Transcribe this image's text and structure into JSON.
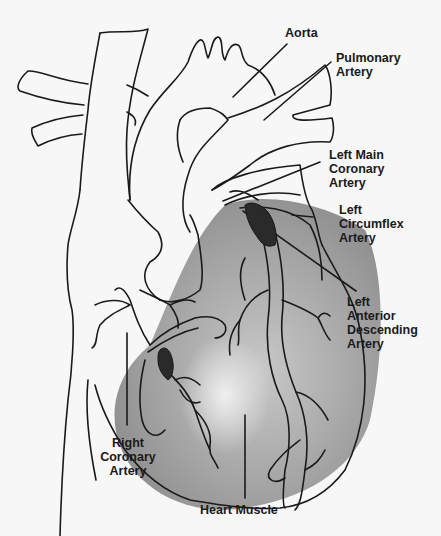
{
  "diagram": {
    "colors": {
      "background": "#f7f7f7",
      "outline": "#1a1a1a",
      "muscle_shade": "#9a9a9a",
      "plaque": "#2a2a2a"
    },
    "labels": {
      "aorta": {
        "lines": [
          "Aorta"
        ]
      },
      "pulmonary_artery": {
        "lines": [
          "Pulmonary",
          "Artery"
        ]
      },
      "left_main_coronary_artery": {
        "lines": [
          "Left Main",
          "Coronary",
          "Artery"
        ]
      },
      "left_circumflex_artery": {
        "lines": [
          "Left",
          "Circumflex",
          "Artery"
        ]
      },
      "left_anterior_descending_artery": {
        "lines": [
          "Left",
          "Anterior",
          "Descending",
          "Artery"
        ]
      },
      "right_coronary_artery": {
        "lines": [
          "Right",
          "Coronary",
          "Artery"
        ]
      },
      "heart_muscle": {
        "lines": [
          "Heart Muscle"
        ]
      }
    }
  }
}
